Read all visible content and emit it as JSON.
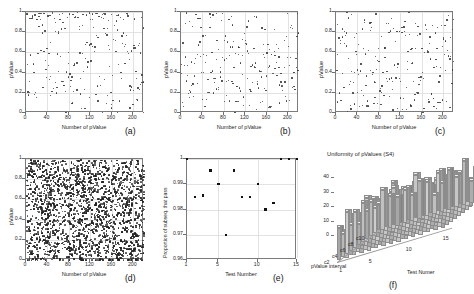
{
  "figure": {
    "panels": [
      "a",
      "b",
      "c",
      "d",
      "e",
      "f"
    ],
    "labels": {
      "a": "(a)",
      "b": "(b)",
      "c": "(c)",
      "d": "(d)",
      "e": "(e)",
      "f": "(f)"
    }
  },
  "chart_data": [
    {
      "id": "a",
      "type": "scatter",
      "title": "",
      "panel_label": "(a)",
      "xlabel": "Number of pValue",
      "ylabel": "pValue",
      "xlim": [
        0,
        220
      ],
      "ylim": [
        0,
        1
      ],
      "xticks": [
        0,
        40,
        80,
        120,
        160,
        200
      ],
      "yticks": [
        0,
        0.2,
        0.4,
        0.6,
        0.8,
        1
      ],
      "ytick_labels": [
        "0",
        "0.2",
        "0.4",
        "0.6",
        "0.8",
        "1"
      ],
      "grid": true,
      "n_points": 215,
      "point_density": "sparse",
      "description": "Uniformly scattered pValues between 0 and 1 with a denser band near 1",
      "points_seed": 11,
      "cluster_top": true
    },
    {
      "id": "b",
      "type": "scatter",
      "title": "",
      "panel_label": "(b)",
      "xlabel": "Number of pValue",
      "ylabel": "pValue",
      "xlim": [
        0,
        220
      ],
      "ylim": [
        0,
        1
      ],
      "xticks": [
        0,
        40,
        80,
        120,
        160,
        200
      ],
      "yticks": [
        0,
        0.2,
        0.4,
        0.6,
        0.8,
        1
      ],
      "ytick_labels": [
        "0",
        "0.2",
        "0.4",
        "0.6",
        "0.8",
        "1"
      ],
      "grid": true,
      "n_points": 210,
      "point_density": "sparse",
      "description": "Uniformly scattered pValues between 0 and 1",
      "points_seed": 27,
      "cluster_top": false
    },
    {
      "id": "c",
      "type": "scatter",
      "title": "",
      "panel_label": "(c)",
      "xlabel": "Number of pValue",
      "ylabel": "pValue",
      "xlim": [
        0,
        220
      ],
      "ylim": [
        0,
        1
      ],
      "xticks": [
        0,
        40,
        80,
        120,
        160,
        200
      ],
      "yticks": [
        0,
        0.2,
        0.4,
        0.6,
        0.8,
        1
      ],
      "ytick_labels": [
        "0",
        "0.2",
        "0.4",
        "0.6",
        "0.8",
        "1"
      ],
      "grid": true,
      "n_points": 205,
      "point_density": "sparse",
      "description": "Uniformly scattered pValues between 0 and 1",
      "points_seed": 43,
      "cluster_top": false
    },
    {
      "id": "d",
      "type": "scatter",
      "title": "",
      "panel_label": "(d)",
      "xlabel": "Number of pValue",
      "ylabel": "pValue",
      "xlim": [
        0,
        220
      ],
      "ylim": [
        0,
        1
      ],
      "xticks": [
        0,
        40,
        80,
        120,
        160,
        200
      ],
      "yticks": [
        0,
        0.2,
        0.4,
        0.6,
        0.8,
        1
      ],
      "ytick_labels": [
        "0",
        "0.2",
        "0.4",
        "0.6",
        "0.8",
        "1"
      ],
      "grid": true,
      "n_points": 980,
      "point_density": "dense",
      "description": "Very dense uniform scatter of pValues between 0 and 1",
      "points_seed": 67,
      "cluster_top": false
    },
    {
      "id": "e",
      "type": "scatter",
      "title": "",
      "panel_label": "(e)",
      "xlabel": "Test Number",
      "ylabel": "Proportion of subseq. that pass",
      "xlim": [
        1,
        15
      ],
      "ylim": [
        0.96,
        1
      ],
      "xticks": [
        1,
        5,
        10,
        15
      ],
      "yticks": [
        0.96,
        0.97,
        0.98,
        0.99,
        1
      ],
      "ytick_labels": [
        "0.96",
        "0.97",
        "0.98",
        "0.99",
        "1"
      ],
      "grid": true,
      "x": [
        1,
        2,
        3,
        4,
        5,
        6,
        7,
        8,
        9,
        10,
        11,
        12,
        13,
        14,
        15
      ],
      "values": [
        1.0,
        0.985,
        0.9855,
        0.9955,
        0.99,
        0.97,
        0.9955,
        0.985,
        0.985,
        0.99,
        0.98,
        0.9825,
        1.0,
        1.0,
        1.0
      ]
    },
    {
      "id": "f",
      "type": "bar",
      "title": "Uniformity of pValues (S4)",
      "panel_label": "(f)",
      "xlabel": "Test Numer",
      "ylabel": "pValue interval",
      "zlabel": "",
      "projection": "3d",
      "xticks": [
        1,
        5,
        10,
        15
      ],
      "ytick_labels": [
        "c2",
        "c4",
        "c6",
        "c8",
        "c10"
      ],
      "zticks": [
        0,
        10,
        20,
        30,
        40
      ],
      "zlim": [
        0,
        45
      ],
      "rows": 10,
      "cols": 15,
      "values": [
        [
          22,
          18,
          25,
          14,
          30,
          19,
          24,
          16,
          28,
          21,
          17,
          26,
          20,
          15,
          23
        ],
        [
          16,
          27,
          13,
          22,
          18,
          31,
          15,
          25,
          19,
          14,
          28,
          17,
          24,
          21,
          18
        ],
        [
          29,
          15,
          21,
          26,
          12,
          23,
          33,
          18,
          14,
          27,
          20,
          16,
          22,
          30,
          19
        ],
        [
          18,
          23,
          17,
          31,
          25,
          14,
          20,
          28,
          22,
          16,
          24,
          19,
          13,
          26,
          21
        ],
        [
          25,
          19,
          28,
          15,
          21,
          27,
          17,
          23,
          31,
          18,
          13,
          29,
          24,
          16,
          22
        ],
        [
          14,
          31,
          20,
          24,
          17,
          22,
          29,
          13,
          26,
          23,
          19,
          15,
          28,
          20,
          25
        ],
        [
          27,
          16,
          23,
          19,
          34,
          15,
          21,
          30,
          17,
          25,
          22,
          18,
          14,
          27,
          20
        ],
        [
          19,
          24,
          30,
          13,
          26,
          20,
          16,
          22,
          28,
          15,
          31,
          23,
          18,
          21,
          17
        ],
        [
          23,
          20,
          15,
          28,
          19,
          25,
          32,
          17,
          21,
          29,
          14,
          26,
          22,
          18,
          24
        ],
        [
          17,
          28,
          22,
          20,
          23,
          18,
          26,
          24,
          13,
          20,
          27,
          21,
          30,
          15,
          19
        ]
      ]
    }
  ]
}
